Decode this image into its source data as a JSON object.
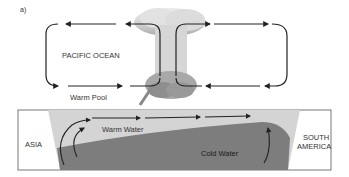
{
  "panel_label": "a)",
  "labels": {
    "pacific_ocean": "PACIFIC OCEAN",
    "warm_pool": "Warm Pool",
    "warm_water": "Warm Water",
    "cold_water": "Cold Water",
    "asia": "ASIA",
    "south_america_line1": "SOUTH",
    "south_america_line2": "AMERICA"
  },
  "colors": {
    "warm_water": "#d4d4d4",
    "cold_water": "#7d7d7d",
    "land": "#ffffff",
    "arrows": "#222222",
    "cloud": "#bdbdbd"
  }
}
